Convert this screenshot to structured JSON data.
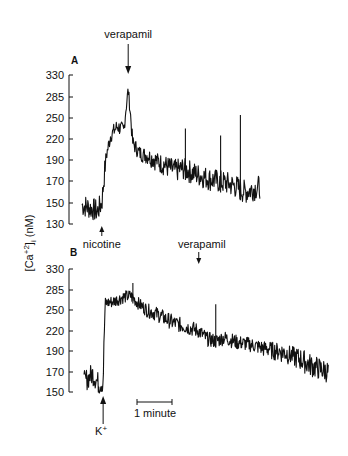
{
  "figure": {
    "y_axis_label": "[Ca+2]i (nM)",
    "scale_bar_label": "1 minute"
  },
  "chart_data": [
    {
      "type": "line",
      "panel": "A",
      "title": "A",
      "xlabel": "time",
      "ylabel": "[Ca+2]i (nM)",
      "yticks": [
        130,
        150,
        170,
        190,
        220,
        250,
        285,
        330
      ],
      "ylim": [
        130,
        330
      ],
      "grid": false,
      "annotations": [
        {
          "label": "nicotine",
          "position": "below",
          "time_min": 0.45
        },
        {
          "label": "verapamil",
          "position": "above",
          "time_min": 1.05
        }
      ],
      "x_minutes": [
        0.0,
        0.2,
        0.35,
        0.45,
        0.55,
        0.65,
        0.8,
        0.95,
        1.05,
        1.15,
        1.3,
        1.5,
        1.7,
        1.9,
        2.1,
        2.3,
        2.5,
        2.7,
        2.9,
        3.1,
        3.3,
        3.5,
        3.7,
        3.9,
        4.05
      ],
      "values": [
        148,
        145,
        142,
        150,
        195,
        225,
        238,
        232,
        300,
        215,
        200,
        196,
        190,
        185,
        180,
        182,
        178,
        175,
        172,
        170,
        168,
        165,
        160,
        163,
        165
      ],
      "transient_spikes": [
        {
          "time_min": 2.35,
          "value": 235
        },
        {
          "time_min": 3.15,
          "value": 225
        },
        {
          "time_min": 3.6,
          "value": 255
        }
      ]
    },
    {
      "type": "line",
      "panel": "B",
      "title": "B",
      "xlabel": "time",
      "ylabel": "[Ca+2]i (nM)",
      "yticks": [
        150,
        170,
        190,
        220,
        250,
        285,
        330
      ],
      "ylim": [
        150,
        330
      ],
      "grid": false,
      "annotations": [
        {
          "label": "K+",
          "position": "below",
          "time_min": 0.45
        },
        {
          "label": "verapamil",
          "position": "above",
          "time_min": 2.7
        }
      ],
      "x_minutes": [
        0.0,
        0.2,
        0.35,
        0.45,
        0.5,
        0.7,
        0.9,
        1.1,
        1.3,
        1.5,
        1.7,
        1.9,
        2.1,
        2.3,
        2.5,
        2.7,
        2.9,
        3.1,
        3.3,
        3.6,
        3.9,
        4.2,
        4.5,
        4.8,
        5.1,
        5.4,
        5.75
      ],
      "values": [
        160,
        168,
        158,
        160,
        262,
        265,
        272,
        275,
        260,
        250,
        245,
        238,
        232,
        228,
        224,
        220,
        208,
        205,
        210,
        203,
        200,
        195,
        192,
        188,
        182,
        175,
        170
      ],
      "transient_spikes": [
        {
          "time_min": 1.15,
          "value": 300
        },
        {
          "time_min": 3.1,
          "value": 260
        }
      ]
    }
  ]
}
